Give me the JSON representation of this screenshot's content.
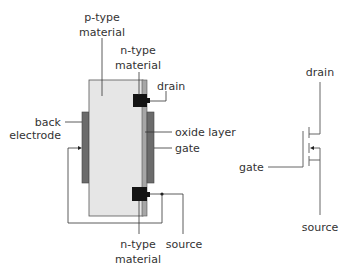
{
  "labels": {
    "p_type": [
      "p-type",
      "material"
    ],
    "n_type_top": [
      "n-type",
      "material"
    ],
    "drain": "drain",
    "back_electrode": [
      "back",
      "electrode"
    ],
    "oxide_layer": "oxide layer",
    "gate": "gate",
    "n_type_bottom": [
      "n-type",
      "material"
    ],
    "source": "source"
  },
  "symbol": {
    "drain": "drain",
    "gate": "gate",
    "source": "source"
  },
  "colors": {
    "substrate": "#e6e6e6",
    "substrate_border": "#555555",
    "oxide": "#a6a6a6",
    "electrode": "#6b6b6b",
    "n_region": "#141414",
    "wire": "#333333",
    "symbol_line": "#555555"
  }
}
